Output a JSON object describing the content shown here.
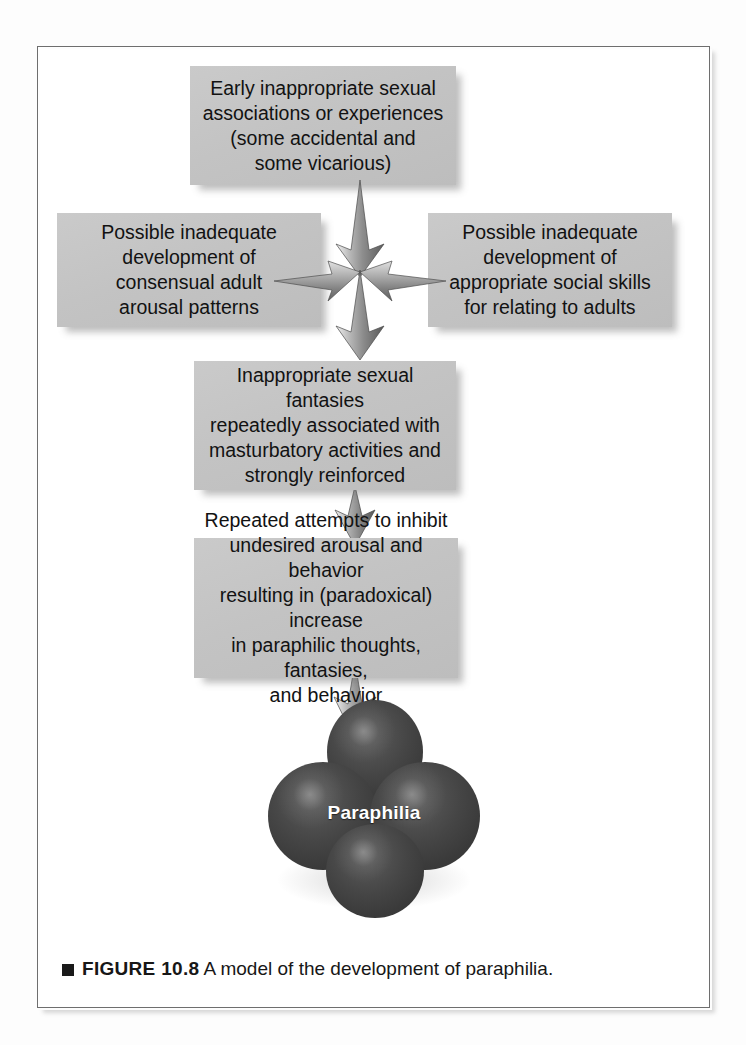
{
  "figure": {
    "caption_marker": "square-bullet",
    "caption_label": "FIGURE 10.8",
    "caption_text": " A model of the development of paraphilia."
  },
  "colors": {
    "box_fill": "#c3c3c3",
    "box_text": "#121212",
    "arrow_light": "#e8e8e8",
    "arrow_dark": "#6a6a6a",
    "circle_fill": "#3f3f3f",
    "circle_text": "#ffffff",
    "frame_border": "#6e6e6e",
    "page_background": "#ffffff"
  },
  "diagram": {
    "type": "flowchart",
    "title": "A model of the development of paraphilia",
    "nodes": [
      {
        "id": "box-top",
        "shape": "rectangle",
        "text": "Early inappropriate sexual associations or experiences (some accidental and some vicarious)",
        "lines": [
          "Early inappropriate sexual",
          "associations or experiences",
          "(some accidental and",
          "some vicarious)"
        ]
      },
      {
        "id": "box-left",
        "shape": "rectangle",
        "text": "Possible inadequate development of consensual adult arousal patterns",
        "lines": [
          "Possible inadequate",
          "development of",
          "consensual adult",
          "arousal patterns"
        ]
      },
      {
        "id": "box-right",
        "shape": "rectangle",
        "text": "Possible inadequate development of appropriate social skills for relating to adults",
        "lines": [
          "Possible inadequate",
          "development of",
          "appropriate social skills",
          "for relating to adults"
        ]
      },
      {
        "id": "box-middle",
        "shape": "rectangle",
        "text": "Inappropriate sexual fantasies repeatedly associated with masturbatory activities and strongly reinforced",
        "lines": [
          "Inappropriate sexual fantasies",
          "repeatedly associated with",
          "masturbatory activities and",
          "strongly reinforced"
        ]
      },
      {
        "id": "box-fourth",
        "shape": "rectangle",
        "text": "Repeated attempts to inhibit undesired arousal and behavior resulting in (paradoxical) increase in paraphilic thoughts, fantasies, and behavior",
        "lines": [
          "Repeated attempts to inhibit",
          "undesired arousal and behavior",
          "resulting in (paradoxical) increase",
          "in paraphilic thoughts, fantasies,",
          "and behavior"
        ]
      },
      {
        "id": "outcome-clover",
        "shape": "four-circle-cluster",
        "text": "Paraphilia"
      }
    ],
    "connectors": [
      {
        "id": "cluster-down-in",
        "from": "box-top",
        "to": "arrow-cluster",
        "direction": "down",
        "style": "shaded-arrow"
      },
      {
        "id": "cluster-left",
        "from": "arrow-cluster",
        "to": "box-left",
        "direction": "left",
        "style": "shaded-arrow"
      },
      {
        "id": "cluster-right",
        "from": "arrow-cluster",
        "to": "box-right",
        "direction": "right",
        "style": "shaded-arrow"
      },
      {
        "id": "cluster-down-out",
        "from": "arrow-cluster",
        "to": "box-middle",
        "direction": "down",
        "style": "shaded-arrow"
      },
      {
        "id": "arrow-3to4",
        "from": "box-middle",
        "to": "box-fourth",
        "direction": "down",
        "style": "shaded-arrow"
      },
      {
        "id": "arrow-4to5",
        "from": "box-fourth",
        "to": "outcome-clover",
        "direction": "down",
        "style": "shaded-arrow"
      }
    ]
  },
  "bleed_text": {
    "l1": "the development of paraphilia",
    "l2": "an extensive treatment study",
    "l3": "paraphilic behavior patterns",
    "l4": "relationship difficulties and",
    "l5": "is directed toward the child",
    "l6": "of the individuals in treatment"
  }
}
